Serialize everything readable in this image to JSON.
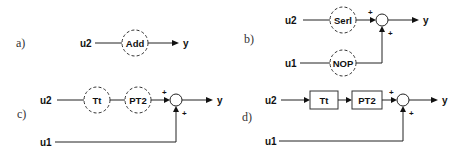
{
  "panels": {
    "a": {
      "label": "a)",
      "inputs": {
        "u2": "u2"
      },
      "blocks": [
        {
          "name": "Add",
          "style": "dashed-circle"
        }
      ],
      "output": "y"
    },
    "b": {
      "label": "b)",
      "inputs": {
        "u2": "u2",
        "u1": "u1"
      },
      "blocks": [
        {
          "name": "Serl",
          "style": "dashed-circle"
        },
        {
          "name": "NOP",
          "style": "dashed-circle"
        }
      ],
      "sum_signs": [
        "+",
        "+"
      ],
      "output": "y"
    },
    "c": {
      "label": "c)",
      "inputs": {
        "u2": "u2",
        "u1": "u1"
      },
      "blocks": [
        {
          "name": "Tt",
          "style": "dashed-circle"
        },
        {
          "name": "PT2",
          "style": "dashed-circle"
        }
      ],
      "sum_signs": [
        "+",
        "+"
      ],
      "output": "y"
    },
    "d": {
      "label": "d)",
      "inputs": {
        "u2": "u2",
        "u1": "u1"
      },
      "blocks": [
        {
          "name": "Tt",
          "style": "box"
        },
        {
          "name": "PT2",
          "style": "box"
        }
      ],
      "sum_signs": [
        "+",
        "+"
      ],
      "output": "y"
    }
  }
}
